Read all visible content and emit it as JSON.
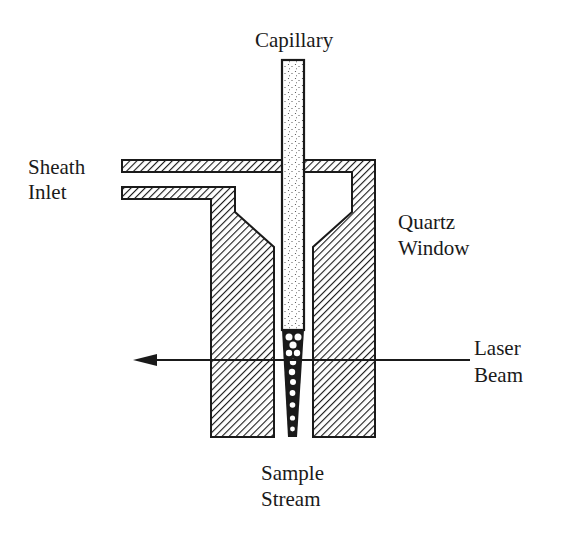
{
  "diagram": {
    "type": "flow cell schematic (sheath flow cuvette)",
    "labels": {
      "capillary": "Capillary",
      "sheath_line1": "Sheath",
      "sheath_line2": "Inlet",
      "quartz_line1": "Quartz",
      "quartz_line2": "Window",
      "laser_line1": "Laser",
      "laser_line2": "Beam",
      "sample_line1": "Sample",
      "sample_line2": "Stream"
    },
    "components": [
      {
        "name": "capillary",
        "fill": "stippled"
      },
      {
        "name": "sheath-inlet-tubes",
        "fill": "hatched"
      },
      {
        "name": "quartz-window-body",
        "fill": "hatched"
      },
      {
        "name": "sample-stream",
        "fill": "beaded"
      },
      {
        "name": "laser-beam",
        "direction": "right-to-left"
      }
    ],
    "colors": {
      "ink": "#1a1a1a",
      "paper": "#ffffff"
    }
  }
}
